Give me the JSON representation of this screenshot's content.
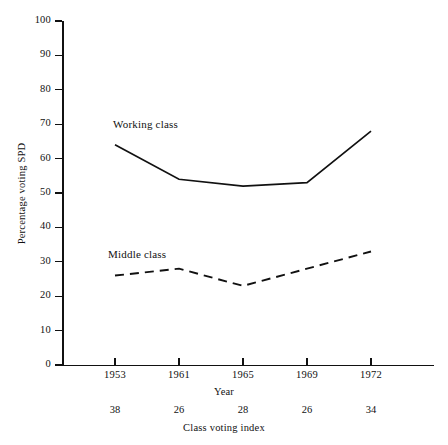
{
  "chart_data": {
    "type": "line",
    "title": "",
    "xlabel": "Year",
    "ylabel": "Percentage voting SPD",
    "categories": [
      "1953",
      "1961",
      "1965",
      "1969",
      "1972"
    ],
    "x": [
      1953,
      1961,
      1965,
      1969,
      1972
    ],
    "ylim": [
      0,
      100
    ],
    "y_ticks": [
      0,
      10,
      20,
      30,
      40,
      50,
      60,
      70,
      80,
      90,
      100
    ],
    "grid": false,
    "legend_position": "inline-annotations",
    "series": [
      {
        "name": "Working class",
        "style": "solid",
        "values": [
          64,
          54,
          52,
          53,
          68
        ]
      },
      {
        "name": "Middle class",
        "style": "dashed",
        "values": [
          26,
          28,
          23,
          28,
          33
        ]
      }
    ],
    "secondary_axis": {
      "label": "Class voting index",
      "values": [
        38,
        26,
        28,
        26,
        34
      ]
    },
    "annotations": [
      {
        "text": "Working class",
        "for_series": "Working class"
      },
      {
        "text": "Middle class",
        "for_series": "Middle class"
      }
    ],
    "colors": {
      "line": "#111111",
      "axis": "#111111",
      "background": "#ffffff"
    }
  }
}
